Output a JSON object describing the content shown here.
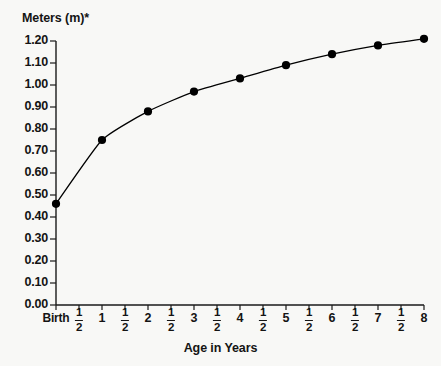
{
  "chart_data": {
    "type": "line",
    "title": "",
    "ylabel": "Meters (m)*",
    "xlabel": "Age in Years",
    "ylim": [
      0.0,
      1.2
    ],
    "ytick_labels": [
      "1.20",
      "1.10",
      "1.00",
      "0.90",
      "0.80",
      "0.70",
      "0.60",
      "0.50",
      "0.40",
      "0.30",
      "0.20",
      "0.10",
      "0.00"
    ],
    "ytick_values": [
      1.2,
      1.1,
      1.0,
      0.9,
      0.8,
      0.7,
      0.6,
      0.5,
      0.4,
      0.3,
      0.2,
      0.1,
      0.0
    ],
    "grid": false,
    "legend": "none",
    "xtick_labels": [
      {
        "text": "Birth",
        "type": "text",
        "x": 0.0
      },
      {
        "text": "1/2",
        "type": "fraction",
        "num": "1",
        "den": "2",
        "x": 0.5
      },
      {
        "text": "1",
        "type": "text",
        "x": 1.0
      },
      {
        "text": "1/2",
        "type": "fraction",
        "num": "1",
        "den": "2",
        "x": 1.5
      },
      {
        "text": "2",
        "type": "text",
        "x": 2.0
      },
      {
        "text": "1/2",
        "type": "fraction",
        "num": "1",
        "den": "2",
        "x": 2.5
      },
      {
        "text": "3",
        "type": "text",
        "x": 3.0
      },
      {
        "text": "1/2",
        "type": "fraction",
        "num": "1",
        "den": "2",
        "x": 3.5
      },
      {
        "text": "4",
        "type": "text",
        "x": 4.0
      },
      {
        "text": "1/2",
        "type": "fraction",
        "num": "1",
        "den": "2",
        "x": 4.5
      },
      {
        "text": "5",
        "type": "text",
        "x": 5.0
      },
      {
        "text": "1/2",
        "type": "fraction",
        "num": "1",
        "den": "2",
        "x": 5.5
      },
      {
        "text": "6",
        "type": "text",
        "x": 6.0
      },
      {
        "text": "1/2",
        "type": "fraction",
        "num": "1",
        "den": "2",
        "x": 6.5
      },
      {
        "text": "7",
        "type": "text",
        "x": 7.0
      },
      {
        "text": "1/2",
        "type": "fraction",
        "num": "1",
        "den": "2",
        "x": 7.5
      },
      {
        "text": "8",
        "type": "text",
        "x": 8.0
      }
    ],
    "xlim": [
      0,
      8
    ],
    "series": [
      {
        "name": "Height",
        "marker": "filled-circle",
        "color": "#000000",
        "x": [
          0,
          1,
          2,
          3,
          4,
          5,
          6,
          7,
          8
        ],
        "values": [
          0.46,
          0.75,
          0.88,
          0.97,
          1.03,
          1.09,
          1.14,
          1.18,
          1.21
        ]
      }
    ]
  },
  "colors": {
    "background": "#f8f8f6",
    "axis": "#1a1a1a",
    "line": "#1a1a1a",
    "marker": "#000000",
    "text": "#141414"
  }
}
